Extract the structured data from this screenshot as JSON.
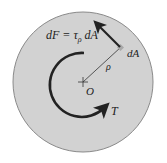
{
  "diagram": {
    "labels": {
      "force": "dF = τ",
      "force_sub": "ρ",
      "force_tail": " dA",
      "element": "dA",
      "radius": "ρ",
      "center": "O",
      "torque": "T"
    },
    "colors": {
      "disk_fill": "#d2d2d2",
      "disk_stroke": "#8a8a8a",
      "arrow": "#222222",
      "element": "#a8a8a8",
      "background": "#ffffff"
    }
  }
}
